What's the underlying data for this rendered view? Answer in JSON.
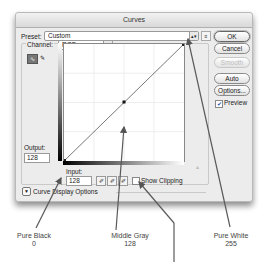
{
  "dialog": {
    "title": "Curves",
    "preset_label": "Preset:",
    "preset_value": "Custom",
    "preset_menu_icon": "list-menu-icon",
    "channel_label": "Channel:",
    "channel_value": "RGB",
    "buttons": {
      "ok": "OK",
      "cancel": "Cancel",
      "smooth": "Smooth",
      "auto": "Auto",
      "options": "Options..."
    },
    "preview_label": "Preview",
    "preview_checked": true,
    "output_label": "Output:",
    "output_value": "128",
    "input_label": "Input:",
    "input_value": "128",
    "show_clipping_label": "Show Clipping",
    "show_clipping_checked": false,
    "curve_display_options_label": "Curve Display Options",
    "tools": [
      "curve-point-tool",
      "pencil-tool"
    ],
    "eyedroppers": [
      "black-point-eyedropper",
      "gray-point-eyedropper",
      "white-point-eyedropper"
    ],
    "curve": {
      "points": [
        [
          0,
          0
        ],
        [
          128,
          128
        ],
        [
          255,
          255
        ]
      ],
      "selected_point": [
        128,
        128
      ]
    }
  },
  "callouts": {
    "pure_black_label": "Pure Black",
    "pure_black_value": "0",
    "middle_gray_label": "Middle Gray",
    "middle_gray_value": "128",
    "pure_white_label": "Pure White",
    "pure_white_value": "255"
  }
}
